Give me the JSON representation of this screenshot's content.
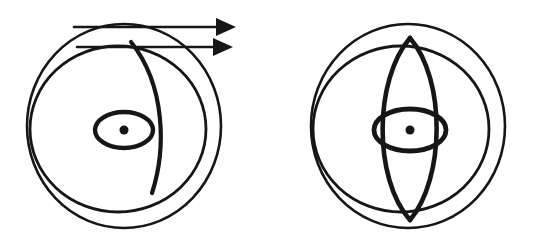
{
  "figure": {
    "type": "line-drawing",
    "title": "",
    "background_color": "#ffffff",
    "ink_color": "#161616",
    "canvas": {
      "width": 535,
      "height": 250
    },
    "panels": [
      {
        "id": "left",
        "name": "left-sphere-diagram",
        "description": "Sphere with offset outer circle, meridian curve and two rightward arrows",
        "outer_circle": {
          "cx": 124,
          "cy": 126,
          "rx": 97,
          "ry": 102
        },
        "inner_circle": {
          "cx": 118,
          "cy": 129,
          "rx": 88,
          "ry": 83
        },
        "equator_ellipse": {
          "cx": 124,
          "cy": 130,
          "rx": 29,
          "ry": 18
        },
        "center_dot": {
          "cx": 124,
          "cy": 130,
          "r": 4.5
        },
        "meridian_curve": {
          "start": [
            131,
            42
          ],
          "control_1": [
            166,
            86
          ],
          "control_2": [
            166,
            150
          ],
          "end": [
            152,
            193
          ]
        },
        "arrows": [
          {
            "name": "upper-arrow",
            "x1": 74,
            "y1": 27,
            "x2": 225,
            "y2": 27,
            "tip_x": 236
          },
          {
            "name": "lower-arrow",
            "x1": 77,
            "y1": 47,
            "x2": 222,
            "y2": 47,
            "tip_x": 233
          }
        ]
      },
      {
        "id": "right",
        "name": "right-sphere-diagram",
        "description": "Sphere with offset outer circle, vertical lens (vesica) and equator",
        "outer_circle": {
          "cx": 408,
          "cy": 126,
          "rx": 97,
          "ry": 102
        },
        "inner_circle": {
          "cx": 401,
          "cy": 129,
          "rx": 88,
          "ry": 83
        },
        "equator_ellipse": {
          "cx": 410,
          "cy": 130,
          "rx": 36,
          "ry": 21
        },
        "center_dot": {
          "cx": 410,
          "cy": 130,
          "r": 4.5
        },
        "lens": {
          "top": [
            410,
            38
          ],
          "bottom": [
            410,
            220
          ],
          "left_bulge_x": 374,
          "right_bulge_x": 446
        }
      }
    ]
  },
  "chart_data": {
    "type": "diagram",
    "title": "",
    "xlabel": "",
    "ylabel": "",
    "annotations": [
      "two rightward arrows above left sphere",
      "meridian curve across left sphere",
      "vertical lens across right sphere"
    ],
    "legend": []
  }
}
